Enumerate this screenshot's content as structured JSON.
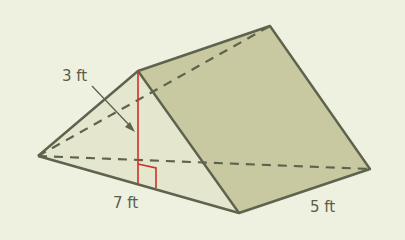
{
  "diagram": {
    "type": "triangular-prism",
    "labels": {
      "height": "3 ft",
      "base": "7 ft",
      "length": "5 ft"
    },
    "colors": {
      "background": "#eef0e0",
      "front_face": "#e3e6cc",
      "side_face": "#c9c9a2",
      "edge": "#5e634e",
      "height_line": "#d0302a"
    }
  }
}
